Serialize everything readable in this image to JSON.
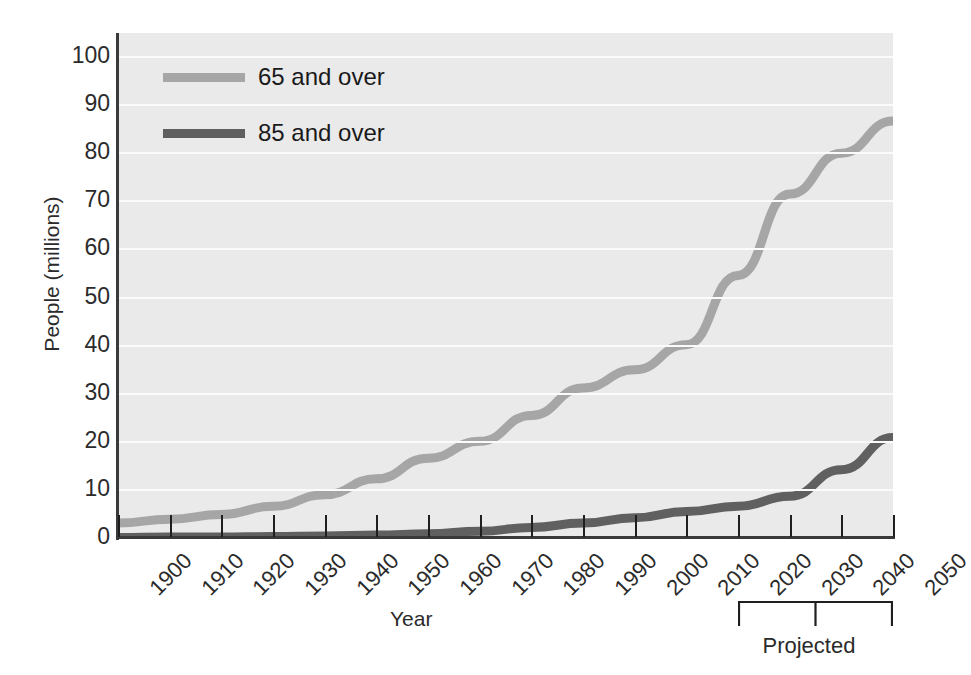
{
  "chart_data": {
    "type": "line",
    "title": "",
    "xlabel": "Year",
    "ylabel": "People (millions)",
    "xlim": [
      1900,
      2050
    ],
    "ylim": [
      0,
      105
    ],
    "ytick_values": [
      0,
      10,
      20,
      30,
      40,
      50,
      60,
      70,
      80,
      90,
      100
    ],
    "ytick_labels": [
      "0",
      "10",
      "20",
      "30",
      "40",
      "50",
      "60",
      "70",
      "80",
      "90",
      "100"
    ],
    "x": [
      1900,
      1910,
      1920,
      1930,
      1940,
      1950,
      1960,
      1970,
      1980,
      1990,
      2000,
      2010,
      2020,
      2030,
      2040,
      2050
    ],
    "xtick_labels": [
      "1900",
      "1910",
      "1920",
      "1930",
      "1940",
      "1950",
      "1960",
      "1970",
      "1980",
      "1990",
      "2000",
      "2010",
      "2020",
      "2030",
      "2040",
      "2050"
    ],
    "grid": "horizontal",
    "legend_position": "top-left",
    "series": [
      {
        "name": "65 and over",
        "color": "#a6a6a6",
        "values": [
          3.1,
          3.9,
          4.9,
          6.6,
          9.0,
          12.3,
          16.6,
          20.1,
          25.5,
          31.2,
          35.0,
          40.2,
          54.6,
          71.5,
          80.0,
          86.7
        ]
      },
      {
        "name": "85 and over",
        "color": "#606060",
        "values": [
          0.1,
          0.2,
          0.2,
          0.3,
          0.4,
          0.6,
          0.9,
          1.4,
          2.2,
          3.1,
          4.2,
          5.5,
          6.6,
          8.7,
          14.2,
          20.9
        ]
      }
    ],
    "annotations": [
      {
        "name": "projected-bracket",
        "label": "Projected",
        "x_start": 2020,
        "x_end": 2050
      }
    ]
  },
  "legend": {
    "items": [
      {
        "label": "65 and over",
        "color": "#a6a6a6"
      },
      {
        "label": "85 and over",
        "color": "#606060"
      }
    ]
  },
  "axes": {
    "y_title": "People (millions)",
    "x_title": "Year"
  },
  "projected": {
    "label": "Projected"
  },
  "colors": {
    "plot_background": "#eaeaea",
    "gridline": "#fbfbfb",
    "axis": "#3a3a3a",
    "series_65": "#a6a6a6",
    "series_85": "#606060"
  }
}
